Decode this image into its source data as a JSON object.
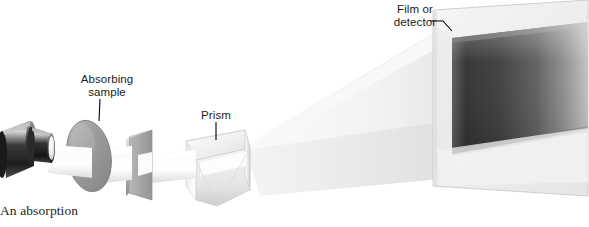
{
  "figure": {
    "kind": "optical-diagram",
    "background_color": "#ffffff"
  },
  "labels": {
    "absorbing_sample": "Absorbing\nsample",
    "prism": "Prism",
    "film_or_detector": "Film or\ndetector",
    "caption": "An absorption"
  },
  "components": [
    {
      "name": "light-source",
      "label": "",
      "description": "dark cylindrical lamp housing with bright circular aperture"
    },
    {
      "name": "absorbing-sample",
      "label": "Absorbing sample",
      "description": "gray tilted elliptical disc in the beam path"
    },
    {
      "name": "slit-plate",
      "label": "",
      "description": "gray plate in perspective with a horizontal slit"
    },
    {
      "name": "prism",
      "label": "Prism",
      "description": "triangular glass prism dispersing the beam"
    },
    {
      "name": "dispersed-beam",
      "label": "",
      "description": "pale fanned wedge of dispersed light"
    },
    {
      "name": "film-or-detector",
      "label": "Film or detector",
      "description": "large translucent screen showing a dark spectrum band"
    }
  ],
  "colors": {
    "lamp_dark": "#2b2b2b",
    "lamp_mid": "#6e6e6e",
    "aperture_light": "#eeeeea",
    "sample_gray": "#9a9a9a",
    "plate_gray": "#a6a6a6",
    "prism_light": "#f2f2f2",
    "prism_shade": "#c9c9c9",
    "beam_light": "#f6f6f6",
    "screen_light": "#ececec",
    "spectrum_dark": "#3a3a3a",
    "leader_line": "#000000",
    "text": "#1b1b1b"
  }
}
